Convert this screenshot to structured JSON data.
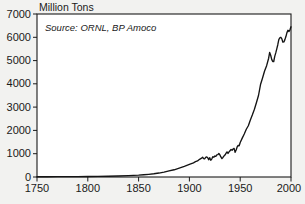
{
  "chart_data": {
    "type": "line",
    "title": "Million Tons",
    "xlabel": "",
    "ylabel": "Million Tons",
    "annotation": "Source: ORNL, BP Amoco",
    "grid": false,
    "legend": "none",
    "xlim": [
      1750,
      2000
    ],
    "ylim": [
      0,
      7000
    ],
    "xticks": [
      1750,
      1800,
      1850,
      1900,
      1950,
      2000
    ],
    "xtick_labels": [
      "1750",
      "1800",
      "1850",
      "1900",
      "1950",
      "2000"
    ],
    "yticks": [
      0,
      1000,
      2000,
      3000,
      4000,
      5000,
      6000,
      7000
    ],
    "ytick_labels": [
      "0",
      "1000",
      "2000",
      "3000",
      "4000",
      "5000",
      "6000",
      "7000"
    ],
    "line_color": "#141414",
    "plot_background": "#ffffff",
    "page_background": "#f2f2f0",
    "series": [
      {
        "name": "Global carbon emissions",
        "x": [
          1750,
          1760,
          1770,
          1780,
          1790,
          1800,
          1810,
          1820,
          1830,
          1840,
          1850,
          1855,
          1860,
          1865,
          1870,
          1875,
          1880,
          1885,
          1890,
          1895,
          1900,
          1902,
          1904,
          1906,
          1908,
          1910,
          1912,
          1913,
          1914,
          1915,
          1916,
          1917,
          1918,
          1919,
          1920,
          1921,
          1922,
          1923,
          1924,
          1925,
          1926,
          1927,
          1928,
          1929,
          1930,
          1931,
          1932,
          1933,
          1934,
          1935,
          1936,
          1937,
          1938,
          1939,
          1940,
          1941,
          1942,
          1943,
          1944,
          1945,
          1946,
          1947,
          1948,
          1949,
          1950,
          1952,
          1954,
          1956,
          1958,
          1960,
          1962,
          1964,
          1966,
          1968,
          1970,
          1972,
          1974,
          1976,
          1978,
          1979,
          1980,
          1981,
          1982,
          1983,
          1984,
          1985,
          1986,
          1987,
          1988,
          1989,
          1990,
          1991,
          1992,
          1993,
          1994,
          1995,
          1996,
          1997,
          1998,
          1999,
          2000
        ],
        "values": [
          10,
          12,
          14,
          16,
          19,
          22,
          27,
          33,
          42,
          56,
          78,
          95,
          115,
          140,
          170,
          210,
          260,
          310,
          380,
          455,
          540,
          575,
          610,
          660,
          690,
          760,
          810,
          850,
          790,
          780,
          840,
          860,
          830,
          740,
          830,
          720,
          770,
          870,
          850,
          900,
          890,
          950,
          960,
          1010,
          950,
          860,
          790,
          840,
          900,
          940,
          1010,
          1080,
          1010,
          1080,
          1130,
          1180,
          1150,
          1200,
          1230,
          1060,
          1160,
          1290,
          1360,
          1340,
          1480,
          1670,
          1850,
          2050,
          2200,
          2450,
          2670,
          2910,
          3200,
          3500,
          3970,
          4250,
          4550,
          4780,
          5100,
          5350,
          5230,
          5050,
          4960,
          4960,
          5180,
          5330,
          5500,
          5680,
          5900,
          5980,
          6000,
          5930,
          5790,
          5800,
          5900,
          6030,
          6200,
          6300,
          6250,
          6320,
          6450
        ]
      }
    ]
  },
  "page": {
    "title_text": "Million Tons",
    "source_text": "Source: ORNL, BP Amoco"
  }
}
